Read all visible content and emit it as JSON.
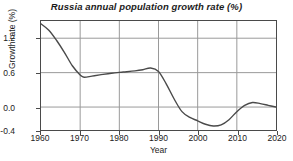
{
  "chart_data": {
    "type": "line",
    "title": "Russia annual population growth rate (%)",
    "xlabel": "Year",
    "ylabel": "Growth rate (%)",
    "xlim": [
      1960,
      2020
    ],
    "ylim": [
      -0.4,
      1.5
    ],
    "xticks": [
      1960,
      1970,
      1980,
      1990,
      2000,
      2010,
      2020
    ],
    "xtick_labels": [
      "1960",
      "1970",
      "1980",
      "1990",
      "2000",
      "2010",
      "2020"
    ],
    "yticks": [
      1.2,
      0.6,
      0.0,
      -0.4
    ],
    "ytick_labels": [
      "1.2",
      "0.6",
      "0.0",
      "-0.4"
    ],
    "grid": true,
    "legend": "none",
    "line_color": "#4a4a4a",
    "grid_color": "#9a9a9a",
    "axis_color": "#4a4a4a",
    "series": [
      {
        "name": "Russia annual population growth rate",
        "x": [
          1960,
          1962,
          1964,
          1966,
          1968,
          1970,
          1971,
          1973,
          1975,
          1978,
          1981,
          1984,
          1986,
          1988,
          1990,
          1992,
          1994,
          1996,
          1998,
          2000,
          2002,
          2004,
          2006,
          2008,
          2010,
          2012,
          2014,
          2016,
          2018,
          2020
        ],
        "values": [
          1.45,
          1.34,
          1.16,
          0.95,
          0.72,
          0.56,
          0.52,
          0.54,
          0.56,
          0.59,
          0.61,
          0.63,
          0.65,
          0.68,
          0.62,
          0.4,
          0.14,
          -0.08,
          -0.18,
          -0.24,
          -0.3,
          -0.33,
          -0.31,
          -0.22,
          -0.08,
          0.03,
          0.08,
          0.06,
          0.03,
          0.0
        ]
      }
    ]
  }
}
